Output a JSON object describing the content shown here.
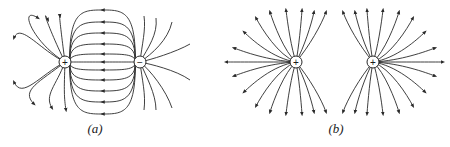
{
  "figure": {
    "panels": [
      {
        "id": "a",
        "label": "(a)",
        "description": "Electric field lines between a positive and a negative point charge (dipole)",
        "charges": [
          {
            "sign": "+",
            "symbol": "+",
            "x": 65,
            "y": 62
          },
          {
            "sign": "-",
            "symbol": "−",
            "x": 140,
            "y": 62
          }
        ],
        "label_pos": {
          "x": 95,
          "y": 121
        }
      },
      {
        "id": "b",
        "label": "(b)",
        "description": "Electric field lines of two equal positive point charges",
        "charges": [
          {
            "sign": "+",
            "symbol": "+",
            "x": 296,
            "y": 62
          },
          {
            "sign": "+",
            "symbol": "+",
            "x": 373,
            "y": 62
          }
        ],
        "label_pos": {
          "x": 336,
          "y": 121
        }
      }
    ],
    "colors": {
      "line": "#2a2a2a",
      "background": "#ffffff"
    }
  }
}
